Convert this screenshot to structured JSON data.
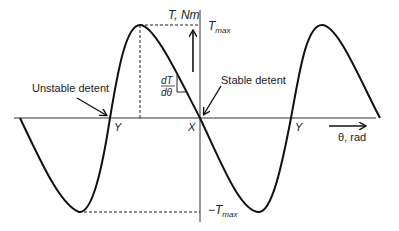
{
  "diagram": {
    "y_axis_label": "T, Nm",
    "x_axis_label": "θ, rad",
    "tmax_label": "T",
    "tmax_sub": "max",
    "neg_tmax_label": "−T",
    "neg_tmax_sub": "max",
    "slope_num": "dT",
    "slope_den": "dθ",
    "unstable_label": "Unstable detent",
    "stable_label": "Stable detent",
    "point_y_left": "Y",
    "point_x": "X",
    "point_y_right": "Y",
    "curve_color": "#111111",
    "axis_color": "#666666"
  }
}
